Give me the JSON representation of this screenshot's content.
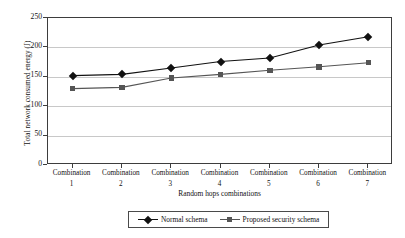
{
  "chart_data": {
    "type": "line",
    "title": "",
    "xlabel": "Random hops combinations",
    "ylabel": "Total network consumed energy (J)",
    "categories": [
      "Combination 1",
      "Combination 2",
      "Combination 3",
      "Combination 4",
      "Combination 5",
      "Combination 6",
      "Combination 7"
    ],
    "category_lines": [
      {
        "name": "Combination",
        "num": "1"
      },
      {
        "name": "Combination",
        "num": "2"
      },
      {
        "name": "Combination",
        "num": "3"
      },
      {
        "name": "Combination",
        "num": "4"
      },
      {
        "name": "Combination",
        "num": "5"
      },
      {
        "name": "Combination",
        "num": "6"
      },
      {
        "name": "Combination",
        "num": "7"
      }
    ],
    "series": [
      {
        "name": "Normal schema",
        "marker": "diamond",
        "color": "#111111",
        "values": [
          152,
          154,
          165,
          176,
          182,
          204,
          218
        ]
      },
      {
        "name": "Proposed security schema",
        "marker": "square",
        "color": "#555555",
        "values": [
          130,
          132,
          148,
          154,
          161,
          167,
          174
        ]
      }
    ],
    "ylim": [
      0,
      250
    ],
    "ytick_values": [
      0,
      50,
      100,
      150,
      200,
      250
    ],
    "ytick_labels": [
      "0",
      "50",
      "100",
      "150",
      "200",
      "250"
    ],
    "grid": true,
    "legend_position": "bottom"
  }
}
